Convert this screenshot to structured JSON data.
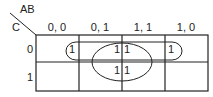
{
  "kmap": {
    "col_variable": "AB",
    "row_variable": "C",
    "col_headers": [
      "0, 0",
      "0, 1",
      "1, 1",
      "1, 0"
    ],
    "row_headers": [
      "0",
      "1"
    ],
    "cells": [
      [
        "",
        "1",
        "1",
        "1"
      ],
      [
        "",
        "1",
        "1",
        ""
      ]
    ],
    "groups": [
      {
        "name": "row-0-pair-wrap",
        "description": "loop around C=0 cells AB=01 through AB=10"
      },
      {
        "name": "center-quad",
        "description": "ellipse around AB=01 and AB=11 cells in both rows"
      }
    ]
  }
}
